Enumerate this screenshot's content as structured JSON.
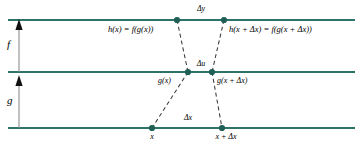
{
  "figure": {
    "colors": {
      "axis_line": "#2d7367",
      "node_fill": "#1f5f55",
      "dashed": "#3a3a3a",
      "arrow": "#6b6b6b",
      "arrow_head": "#111111",
      "text": "#000000",
      "background": "#ffffff"
    },
    "lines": [
      {
        "name": "f-level-line",
        "y": 20
      },
      {
        "name": "u-level-line",
        "y": 72
      },
      {
        "name": "x-level-line",
        "y": 128
      }
    ],
    "arrows": [
      {
        "name": "f-arrow",
        "label": "f",
        "x": 19,
        "from_y": 72,
        "to_y": 22,
        "label_x": 9,
        "label_y": 40
      },
      {
        "name": "g-arrow",
        "label": "g",
        "x": 19,
        "from_y": 128,
        "to_y": 78,
        "label_x": 9,
        "label_y": 96
      }
    ],
    "nodes": [
      {
        "name": "node-h-x",
        "x": 177,
        "y": 20
      },
      {
        "name": "node-h-x-plus-dx",
        "x": 224,
        "y": 20
      },
      {
        "name": "node-g-x",
        "x": 188,
        "y": 72
      },
      {
        "name": "node-g-x-plus-dx",
        "x": 212,
        "y": 72
      },
      {
        "name": "node-x",
        "x": 152,
        "y": 128
      },
      {
        "name": "node-x-plus-dx",
        "x": 222,
        "y": 128
      }
    ],
    "connectors": [
      {
        "name": "connector-hx-to-gx",
        "x1": 177,
        "y1": 20,
        "x2": 188,
        "y2": 72
      },
      {
        "name": "connector-hxdx-to-gxdx",
        "x1": 224,
        "y1": 20,
        "x2": 212,
        "y2": 72
      },
      {
        "name": "connector-gx-to-x",
        "x1": 188,
        "y1": 72,
        "x2": 152,
        "y2": 128
      },
      {
        "name": "connector-gxdx-to-xdx",
        "x1": 212,
        "y1": 72,
        "x2": 222,
        "y2": 128
      }
    ],
    "labels": {
      "f_axis": "f",
      "g_axis": "g",
      "delta_y": "Δy",
      "delta_u": "Δu",
      "delta_x": "Δx",
      "h_of_x": "h(x) = f(g(x))",
      "h_of_x_plus_dx": "h(x + Δx) = f(g(x + Δx))",
      "g_of_x": "g(x)",
      "g_of_x_plus_dx": "g(x + Δx)",
      "x": "x",
      "x_plus_dx": "x + Δx"
    }
  }
}
